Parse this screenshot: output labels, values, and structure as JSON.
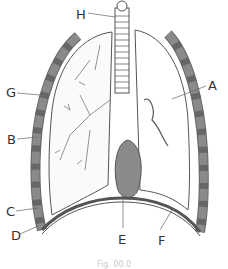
{
  "diagram": {
    "labels": [
      {
        "id": "A",
        "text": "A",
        "x": 208,
        "y": 79
      },
      {
        "id": "B",
        "text": "B",
        "x": 7,
        "y": 133
      },
      {
        "id": "C",
        "text": "C",
        "x": 6,
        "y": 205
      },
      {
        "id": "D",
        "text": "D",
        "x": 11,
        "y": 229
      },
      {
        "id": "E",
        "text": "E",
        "x": 118,
        "y": 233
      },
      {
        "id": "F",
        "text": "F",
        "x": 158,
        "y": 234
      },
      {
        "id": "G",
        "text": "G",
        "x": 6,
        "y": 86
      },
      {
        "id": "H",
        "text": "H",
        "x": 76,
        "y": 8
      }
    ],
    "caption": "Fig. 00.0",
    "colors": {
      "line": "#555555",
      "fill": "#8a8a8a",
      "rib_light": "#f4f4f4"
    }
  }
}
